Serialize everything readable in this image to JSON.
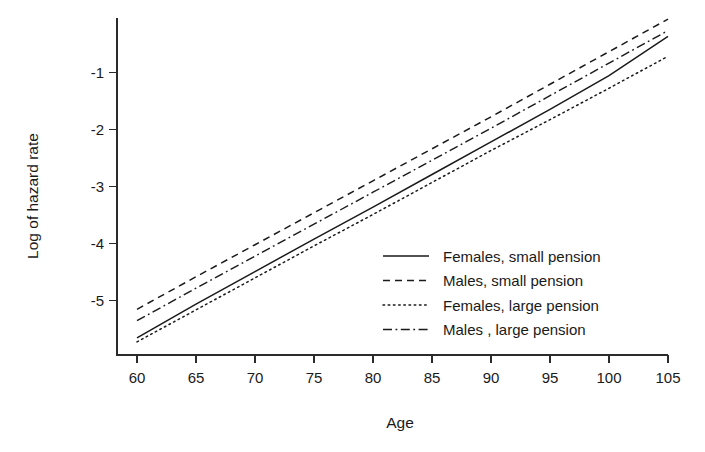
{
  "chart_data": {
    "type": "line",
    "title": "",
    "subtitle": "",
    "xlabel": "Age",
    "ylabel": "Log of hazard rate",
    "xlim": [
      58.5,
      105.8
    ],
    "ylim": [
      -5.95,
      -0.05
    ],
    "xticks": [
      60,
      65,
      70,
      75,
      80,
      85,
      90,
      95,
      100,
      105
    ],
    "xtick_labels": [
      "60",
      "65",
      "70",
      "75",
      "80",
      "85",
      "90",
      "95",
      "100",
      "105"
    ],
    "yticks": [
      -1,
      -2,
      -3,
      -4,
      -5
    ],
    "ytick_labels": [
      "-1",
      "-2",
      "-3",
      "-4",
      "-5"
    ],
    "grid": false,
    "legend_position": "center-right",
    "x": [
      60,
      65,
      70,
      75,
      80,
      85,
      90,
      95,
      100,
      105
    ],
    "series": [
      {
        "name": "Females, small pension",
        "dash": "solid",
        "color": "#1a1a1a",
        "values": [
          -5.65,
          -5.06,
          -4.49,
          -3.92,
          -3.36,
          -2.79,
          -2.22,
          -1.65,
          -1.06,
          -0.37
        ]
      },
      {
        "name": "Males, small pension",
        "dash": "dashed",
        "color": "#1a1a1a",
        "values": [
          -5.15,
          -4.58,
          -4.02,
          -3.46,
          -2.9,
          -2.34,
          -1.78,
          -1.21,
          -0.64,
          -0.07
        ]
      },
      {
        "name": "Females, large pension",
        "dash": "dotted",
        "color": "#1a1a1a",
        "values": [
          -5.72,
          -5.16,
          -4.6,
          -4.04,
          -3.49,
          -2.93,
          -2.37,
          -1.83,
          -1.28,
          -0.72
        ]
      },
      {
        "name": "Males , large pension",
        "dash": "dashdot",
        "color": "#1a1a1a",
        "values": [
          -5.35,
          -4.78,
          -4.22,
          -3.66,
          -3.1,
          -2.54,
          -1.98,
          -1.41,
          -0.84,
          -0.27
        ]
      }
    ]
  },
  "legend": {
    "entries": [
      {
        "label": "Females, small pension",
        "dash": "solid"
      },
      {
        "label": "Males, small pension",
        "dash": "dashed"
      },
      {
        "label": "Females, large pension",
        "dash": "dotted"
      },
      {
        "label": "Males , large pension",
        "dash": "dashdot"
      }
    ]
  },
  "colors": {
    "ink": "#1a1a1a",
    "axis": "#2b2b2b",
    "background": "#ffffff"
  }
}
